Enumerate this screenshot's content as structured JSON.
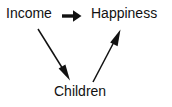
{
  "diagram": {
    "type": "causal-path-diagram",
    "canvas": {
      "width": 172,
      "height": 107,
      "background": "#ffffff"
    },
    "ink_color": "#111111",
    "nodes": [
      {
        "id": "income",
        "label": "Income",
        "x": 6,
        "y": 6
      },
      {
        "id": "happiness",
        "label": "Happiness",
        "x": 91,
        "y": 6
      },
      {
        "id": "children",
        "label": "Children",
        "x": 54,
        "y": 84
      }
    ],
    "edges": [
      {
        "id": "income-to-happiness",
        "from": "Income",
        "to": "Happiness",
        "style": "thick-straight-arrow",
        "direction": "right",
        "start": {
          "x": 62,
          "y": 16
        },
        "end": {
          "x": 81,
          "y": 16
        }
      },
      {
        "id": "income-to-children",
        "from": "Income",
        "to": "Children",
        "style": "thin-straight-arrow",
        "direction": "down-right",
        "start": {
          "x": 38,
          "y": 29
        },
        "end": {
          "x": 70,
          "y": 80
        }
      },
      {
        "id": "children-to-happiness",
        "from": "Children",
        "to": "Happiness",
        "style": "thin-straight-arrow",
        "direction": "up-right",
        "start": {
          "x": 93,
          "y": 82
        },
        "end": {
          "x": 120,
          "y": 30
        }
      }
    ]
  }
}
